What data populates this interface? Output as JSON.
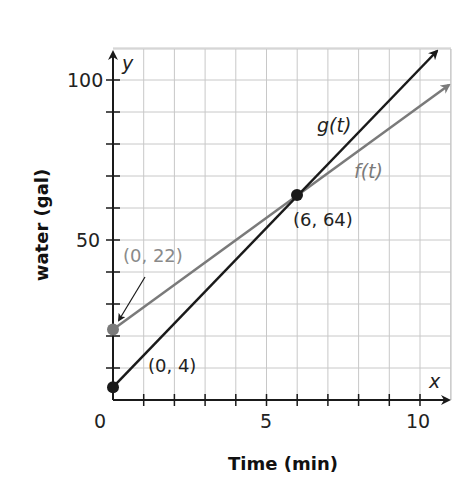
{
  "chart_data": {
    "type": "line",
    "title": "",
    "xlabel": "Time (min)",
    "ylabel": "water (gal)",
    "x_axis_var": "x",
    "y_axis_var": "y",
    "xlim": [
      0,
      11
    ],
    "ylim": [
      0,
      110
    ],
    "x_ticks": [
      0,
      1,
      2,
      3,
      4,
      5,
      6,
      7,
      8,
      9,
      10
    ],
    "x_tick_labels": {
      "0": "0",
      "5": "5",
      "10": "10"
    },
    "y_ticks": [
      10,
      20,
      30,
      40,
      50,
      60,
      70,
      80,
      90,
      100
    ],
    "y_tick_labels": {
      "50": "50",
      "100": "100"
    },
    "grid": true,
    "x_grid_step": 1,
    "y_grid_step": 10,
    "series": [
      {
        "name": "g(t)",
        "label": "g(t)",
        "color": "#1a1a1a",
        "equation": "g(t) = 4 + 10t",
        "x": [
          0,
          6,
          10.6
        ],
        "values": [
          4,
          64,
          110
        ],
        "arrow_end": true
      },
      {
        "name": "f(t)",
        "label": "f(t)",
        "color": "#7a7a7a",
        "equation": "f(t) = 22 + 7t",
        "x": [
          0,
          6,
          10.95
        ],
        "values": [
          22,
          64,
          98.7
        ],
        "arrow_end": true
      }
    ],
    "points": [
      {
        "x": 0,
        "y": 4,
        "label": "(0, 4)",
        "color": "#1a1a1a"
      },
      {
        "x": 0,
        "y": 22,
        "label": "(0, 22)",
        "color": "#7a7a7a"
      },
      {
        "x": 6,
        "y": 64,
        "label": "(6, 64)",
        "color": "#1a1a1a"
      }
    ],
    "annotations": [
      {
        "text": "(0, 22)",
        "arrow_to": [
          0,
          22
        ]
      }
    ]
  },
  "labels": {
    "ylabel": "water (gal)",
    "xlabel": "Time (min)",
    "y_var": "y",
    "x_var": "x",
    "tick_0": "0",
    "tick_x5": "5",
    "tick_x10": "10",
    "tick_y50": "50",
    "tick_y100": "100",
    "g_label": "g(t)",
    "f_label": "f(t)",
    "pt_0_4": "(0, 4)",
    "pt_0_22": "(0, 22)",
    "pt_6_64": "(6, 64)"
  },
  "colors": {
    "g_line": "#1a1a1a",
    "f_line": "#7a7a7a",
    "grid": "#c8c8c8",
    "axis": "#1a1a1a"
  }
}
